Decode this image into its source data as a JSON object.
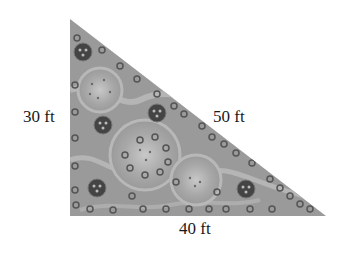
{
  "diagram": {
    "shape": "right triangle",
    "fill_description": "garden with flower beds",
    "sides": {
      "vertical": "30 ft",
      "hypotenuse": "50 ft",
      "horizontal": "40 ft"
    },
    "colors": {
      "fill": "#9a9a9a",
      "path": "#b8b8b8",
      "flower_dark": "#4a4a4a",
      "text": "#1a1a1a"
    }
  }
}
